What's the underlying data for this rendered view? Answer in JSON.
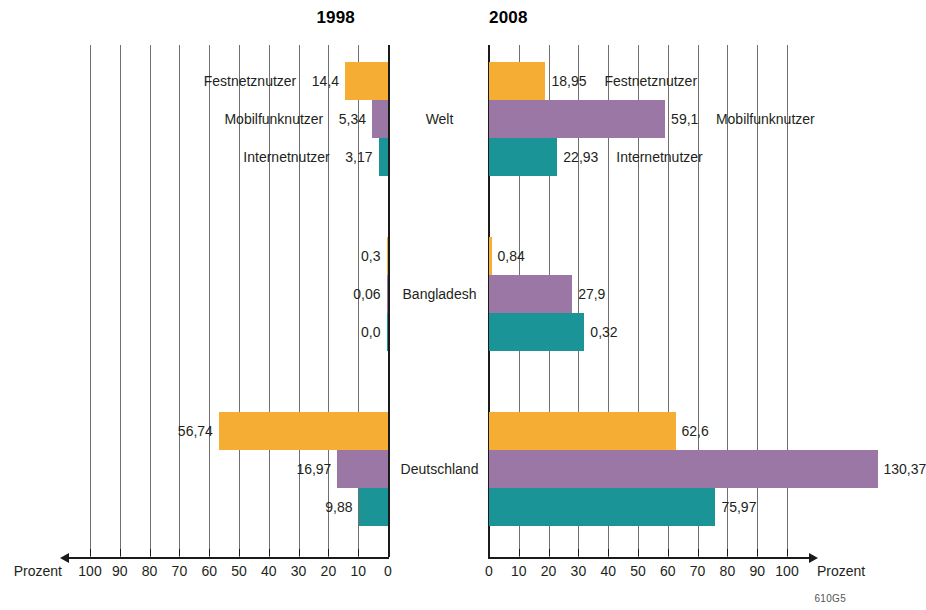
{
  "panels": {
    "left": {
      "title": "1998",
      "axis_caption": "Prozent",
      "ticks": [
        100,
        90,
        80,
        70,
        60,
        50,
        40,
        30,
        20,
        10,
        0
      ]
    },
    "right": {
      "title": "2008",
      "axis_caption": "Prozent",
      "ticks": [
        0,
        10,
        20,
        30,
        40,
        50,
        60,
        70,
        80,
        90,
        100
      ]
    }
  },
  "groups": [
    "Welt",
    "Bangladesh",
    "Deutschland"
  ],
  "series_names": [
    "Festnetznutzer",
    "Mobilfunknutzer",
    "Internetnutzer"
  ],
  "colors": {
    "festnetz": "#f5ad34",
    "mobilfunk": "#9a77a5",
    "internet": "#1a9496",
    "axis": "#1a1a1a",
    "grid": "#6f6f6f"
  },
  "source_code": "610G5",
  "labels": {
    "left": [
      [
        "14,4",
        "5,34",
        "3,17"
      ],
      [
        "0,3",
        "0,06",
        "0,0"
      ],
      [
        "56,74",
        "16,97",
        "9,88"
      ]
    ],
    "right": [
      [
        "18,95",
        "59,1",
        "22,93"
      ],
      [
        "0,84",
        "27,9",
        "0,32"
      ],
      [
        "62,6",
        "130,37",
        "75,97"
      ]
    ]
  },
  "chart_data": {
    "type": "bar",
    "xlabel": "Prozent",
    "ylabel": "",
    "orientation": "horizontal",
    "grid": true,
    "legend": "inline-labels",
    "xlim": [
      0,
      100
    ],
    "xticks": [
      0,
      10,
      20,
      30,
      40,
      50,
      60,
      70,
      80,
      90,
      100
    ],
    "panels": [
      {
        "name": "1998",
        "direction": "left",
        "groups": [
          {
            "name": "Welt",
            "series": [
              {
                "name": "Festnetznutzer",
                "value": 14.4,
                "label": "14,4"
              },
              {
                "name": "Mobilfunknutzer",
                "value": 5.34,
                "label": "5,34"
              },
              {
                "name": "Internetnutzer",
                "value": 3.17,
                "label": "3,17"
              }
            ]
          },
          {
            "name": "Bangladesh",
            "series": [
              {
                "name": "Festnetznutzer",
                "value": 0.3,
                "label": "0,3"
              },
              {
                "name": "Mobilfunknutzer",
                "value": 0.06,
                "label": "0,06"
              },
              {
                "name": "Internetnutzer",
                "value": 0.0,
                "label": "0,0"
              }
            ]
          },
          {
            "name": "Deutschland",
            "series": [
              {
                "name": "Festnetznutzer",
                "value": 56.74,
                "label": "56,74"
              },
              {
                "name": "Mobilfunknutzer",
                "value": 16.97,
                "label": "16,97"
              },
              {
                "name": "Internetnutzer",
                "value": 9.88,
                "label": "9,88"
              }
            ]
          }
        ]
      },
      {
        "name": "2008",
        "direction": "right",
        "groups": [
          {
            "name": "Welt",
            "series": [
              {
                "name": "Festnetznutzer",
                "value": 18.95,
                "label": "18,95"
              },
              {
                "name": "Mobilfunknutzer",
                "value": 59.1,
                "label": "59,1"
              },
              {
                "name": "Internetnutzer",
                "value": 22.93,
                "label": "22,93"
              }
            ]
          },
          {
            "name": "Bangladesh",
            "series": [
              {
                "name": "Festnetznutzer",
                "value": 0.84,
                "label": "0,84"
              },
              {
                "name": "Mobilfunknutzer",
                "value": 27.9,
                "label": "27,9"
              },
              {
                "name": "Internetnutzer",
                "value": 0.32,
                "label": "0,32",
                "drawn_value": 32.0
              }
            ]
          },
          {
            "name": "Deutschland",
            "series": [
              {
                "name": "Festnetznutzer",
                "value": 62.6,
                "label": "62,6"
              },
              {
                "name": "Mobilfunknutzer",
                "value": 130.37,
                "label": "130,37"
              },
              {
                "name": "Internetnutzer",
                "value": 75.97,
                "label": "75,97"
              }
            ]
          }
        ]
      }
    ]
  }
}
